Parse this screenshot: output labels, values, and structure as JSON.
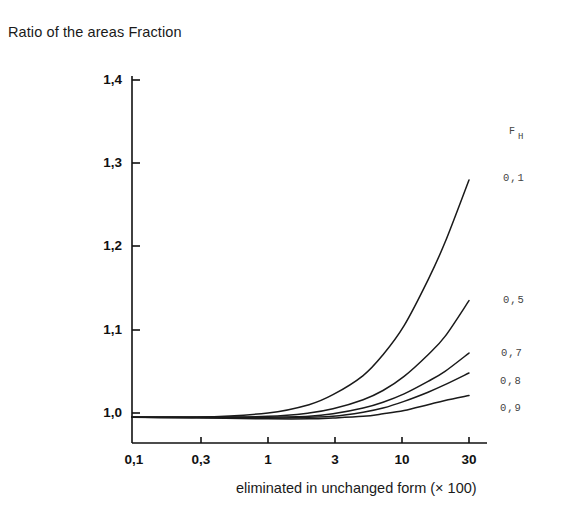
{
  "title": "Ratio of the areas Fraction",
  "xaxis_title": "eliminated in unchanged form (× 100)",
  "legend_head": {
    "symbol": "F",
    "subscript": "H"
  },
  "y_ticks": [
    "1,0",
    "1,1",
    "1,2",
    "1,3",
    "1,4"
  ],
  "x_ticks": [
    "0,1",
    "0,3",
    "1",
    "3",
    "10",
    "30"
  ],
  "series_labels": [
    "0,1",
    "0,5",
    "0,7",
    "0,8",
    "0,9"
  ],
  "colors": {
    "ink": "#111111",
    "curve": "#1a1a1a",
    "background": "#ffffff"
  },
  "chart_data": {
    "type": "line",
    "title": "Ratio of the areas Fraction",
    "xlabel": "eliminated in unchanged form (× 100)",
    "ylabel": "Ratio of the areas Fraction",
    "x_scale": "log",
    "xlim": [
      0.1,
      30
    ],
    "ylim": [
      1.0,
      1.4
    ],
    "x_tick_values": [
      0.1,
      0.3,
      1,
      3,
      10,
      30
    ],
    "x_tick_labels": [
      "0,1",
      "0,3",
      "1",
      "3",
      "10",
      "30"
    ],
    "y_tick_values": [
      1.0,
      1.1,
      1.2,
      1.3,
      1.4
    ],
    "y_tick_labels": [
      "1,0",
      "1,1",
      "1,2",
      "1,3",
      "1,4"
    ],
    "grid": false,
    "legend": "right-inline",
    "legend_title": "F_H",
    "x": [
      0.1,
      0.3,
      1,
      2,
      3,
      5,
      7,
      10,
      15,
      20,
      30
    ],
    "series": [
      {
        "name": "0,1",
        "values": [
          0.995,
          0.995,
          1.0,
          1.01,
          1.022,
          1.045,
          1.07,
          1.105,
          1.16,
          1.205,
          1.28
        ]
      },
      {
        "name": "0,5",
        "values": [
          0.995,
          0.995,
          0.996,
          1.0,
          1.005,
          1.016,
          1.027,
          1.044,
          1.07,
          1.092,
          1.135
        ]
      },
      {
        "name": "0,7",
        "values": [
          0.995,
          0.995,
          0.995,
          0.996,
          0.999,
          1.006,
          1.013,
          1.023,
          1.038,
          1.05,
          1.072
        ]
      },
      {
        "name": "0,8",
        "values": [
          0.995,
          0.995,
          0.994,
          0.995,
          0.996,
          1.001,
          1.006,
          1.014,
          1.025,
          1.034,
          1.048
        ]
      },
      {
        "name": "0,9",
        "values": [
          0.995,
          0.994,
          0.993,
          0.993,
          0.994,
          0.996,
          0.999,
          1.003,
          1.01,
          1.015,
          1.021
        ]
      }
    ]
  }
}
